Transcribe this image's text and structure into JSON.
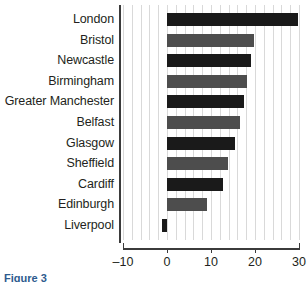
{
  "figure": {
    "caption": "Figure 3"
  },
  "chart_data": {
    "type": "bar",
    "orientation": "horizontal",
    "title": "",
    "xlabel": "",
    "ylabel": "",
    "xlim": [
      -10,
      30
    ],
    "xticks": [
      -10,
      0,
      10,
      20,
      30
    ],
    "xtick_labels": [
      "–10",
      "0",
      "10",
      "20",
      "30"
    ],
    "grid": true,
    "grid_axis": "x",
    "grid_minor_step": 2,
    "legend": "none",
    "categories": [
      "London",
      "Bristol",
      "Newcastle",
      "Birmingham",
      "Greater Manchester",
      "Belfast",
      "Glasgow",
      "Sheffield",
      "Cardiff",
      "Edinburgh",
      "Liverpool"
    ],
    "values": [
      29.7,
      19.7,
      19.2,
      18.2,
      17.4,
      16.6,
      15.5,
      13.8,
      12.7,
      9.0,
      -1.1
    ],
    "colors": [
      "#1a1a1a",
      "#4d4d4d",
      "#1a1a1a",
      "#4d4d4d",
      "#1a1a1a",
      "#4d4d4d",
      "#1a1a1a",
      "#4d4d4d",
      "#1a1a1a",
      "#4d4d4d",
      "#1a1a1a"
    ],
    "axis_color": "#3b3b3b",
    "grid_color": "#d9d9d9",
    "background": "#ffffff"
  }
}
